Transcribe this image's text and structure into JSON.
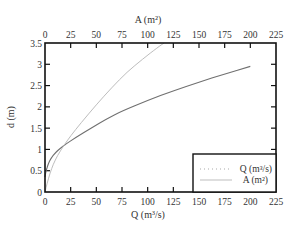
{
  "chart_data": {
    "type": "line",
    "title": "",
    "xlabel": "Q (m3/s)",
    "xlabel_top": "A (m2)",
    "ylabel": "d (m)",
    "xlim": [
      0,
      225
    ],
    "ylim": [
      0,
      3.5
    ],
    "x_ticks": [
      "0",
      "25",
      "50",
      "75",
      "100",
      "125",
      "150",
      "175",
      "200",
      "225"
    ],
    "x_ticks_top": [
      "0",
      "25",
      "50",
      "75",
      "100",
      "125",
      "150",
      "175",
      "200",
      "225"
    ],
    "y_ticks": [
      "0",
      "0.5",
      "1",
      "1.5",
      "2",
      "2.5",
      "3",
      "3.5"
    ],
    "grid": false,
    "legend_position": "lower right",
    "series": [
      {
        "name": "Q (m3/s)",
        "axis": "bottom",
        "color": "#707070",
        "points": [
          [
            0,
            0.35
          ],
          [
            1,
            0.5
          ],
          [
            3,
            0.65
          ],
          [
            6,
            0.8
          ],
          [
            10,
            0.92
          ],
          [
            15,
            1.03
          ],
          [
            20,
            1.12
          ],
          [
            30,
            1.28
          ],
          [
            45,
            1.5
          ],
          [
            60,
            1.72
          ],
          [
            75,
            1.9
          ],
          [
            100,
            2.15
          ],
          [
            125,
            2.38
          ],
          [
            150,
            2.58
          ],
          [
            175,
            2.77
          ],
          [
            200,
            2.95
          ]
        ]
      },
      {
        "name": "A (m2)",
        "axis": "top",
        "color": "#bdbdbd",
        "points": [
          [
            0,
            0
          ],
          [
            2,
            0.2
          ],
          [
            5,
            0.45
          ],
          [
            8,
            0.65
          ],
          [
            12,
            0.85
          ],
          [
            18,
            1.08
          ],
          [
            25,
            1.32
          ],
          [
            35,
            1.62
          ],
          [
            50,
            2.05
          ],
          [
            65,
            2.45
          ],
          [
            80,
            2.82
          ],
          [
            95,
            3.12
          ],
          [
            110,
            3.4
          ],
          [
            116,
            3.5
          ]
        ]
      }
    ]
  },
  "legend": {
    "q_label": "Q (m³/s)",
    "a_label": "A (m²)"
  },
  "axes": {
    "x_bottom_title": "Q (m³/s)",
    "x_top_title": "A (m²)",
    "y_title": "d (m)"
  }
}
